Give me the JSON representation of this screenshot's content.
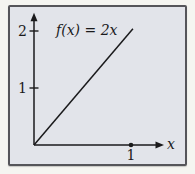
{
  "figure": {
    "function_label": "f(x) = 2x",
    "x_axis_label": "x",
    "colors": {
      "outer_background": "#f5f5f1",
      "panel_background": "#e2e4ea",
      "panel_border": "#55555a",
      "ink": "#1a1a1c"
    }
  },
  "chart_data": {
    "type": "line",
    "title": "f(x) = 2x",
    "xlabel": "x",
    "ylabel": "",
    "xlim": [
      0,
      1.34
    ],
    "ylim": [
      0,
      2.32
    ],
    "grid": false,
    "legend": false,
    "axis_arrows": true,
    "x_ticks": [
      {
        "value": 1,
        "label": "1"
      }
    ],
    "y_ticks": [
      {
        "value": 1,
        "label": "1"
      },
      {
        "value": 2,
        "label": "2"
      }
    ],
    "series": [
      {
        "name": "f(x) = 2x",
        "expression": "f(x) = 2x",
        "slope": 2,
        "intercept": 0,
        "points": [
          {
            "x": 0,
            "y": 0
          },
          {
            "x": 1.02,
            "y": 2.04
          }
        ]
      }
    ],
    "point_markers": [
      {
        "x": 1,
        "y": 0,
        "label": "1",
        "style": "filled-dot"
      }
    ]
  }
}
